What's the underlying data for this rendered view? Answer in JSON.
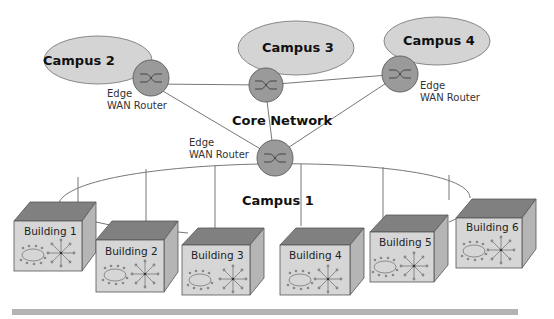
{
  "diagram": {
    "core": {
      "label": "Core Network"
    },
    "campuses": [
      {
        "id": "campus-1",
        "label": "Campus 1"
      },
      {
        "id": "campus-2",
        "label": "Campus 2"
      },
      {
        "id": "campus-3",
        "label": "Campus 3"
      },
      {
        "id": "campus-4",
        "label": "Campus 4"
      }
    ],
    "routers": [
      {
        "id": "router-campus-2",
        "label_line1": "Edge",
        "label_line2": "WAN Router"
      },
      {
        "id": "router-campus-3",
        "label_line1": "",
        "label_line2": ""
      },
      {
        "id": "router-campus-4",
        "label_line1": "Edge",
        "label_line2": "WAN Router"
      },
      {
        "id": "router-campus-1",
        "label_line1": "Edge",
        "label_line2": "WAN Router"
      }
    ],
    "buildings": [
      {
        "label": "Building 1"
      },
      {
        "label": "Building 2"
      },
      {
        "label": "Building 3"
      },
      {
        "label": "Building 4"
      },
      {
        "label": "Building 5"
      },
      {
        "label": "Building 6"
      }
    ],
    "colors": {
      "ellipse_fill": "#d4d4d4",
      "router_fill": "#9a9a9a",
      "box_top": "#808080",
      "box_side": "#b5b5b5",
      "box_front": "#d6d6d6",
      "footer_bar": "#b3b3b3"
    }
  }
}
